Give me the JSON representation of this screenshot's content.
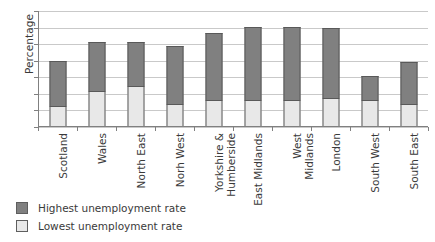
{
  "chart_data": {
    "type": "bar",
    "subtype": "stacked-bar",
    "title": "",
    "xlabel": "",
    "ylabel": "Percentage",
    "ylim": [
      0,
      14
    ],
    "yticks": [
      0,
      2,
      4,
      6,
      8,
      10,
      12,
      14
    ],
    "ytick_labels": [
      "0",
      "2",
      "4",
      "6",
      "8",
      "10",
      "12",
      "14"
    ],
    "grid": true,
    "grid_axis": "y",
    "legend_position": "below-left",
    "categories": [
      "Scotland",
      "Wales",
      "North East",
      "Norh West",
      "Yorkshire &\nHumberside",
      "East Midlands",
      "West Midlands",
      "London",
      "South West",
      "South East"
    ],
    "series": [
      {
        "name": "Lowest unemployment rate",
        "color": "#e8e8e8",
        "values": [
          2.5,
          4.3,
          5.0,
          2.8,
          3.2,
          3.2,
          3.3,
          3.5,
          3.2,
          2.8
        ]
      },
      {
        "name": "Highest unemployment rate",
        "color": "#808080",
        "values": [
          8.0,
          10.3,
          10.25,
          9.8,
          11.4,
          12.1,
          12.05,
          12.0,
          6.1,
          7.8
        ],
        "note": "values are bar tops (cumulative), not segment heights"
      }
    ]
  },
  "legend": {
    "items": [
      {
        "label": "Highest unemployment rate",
        "color": "#808080"
      },
      {
        "label": "Lowest unemployment rate",
        "color": "#e8e8e8"
      }
    ]
  },
  "colors": {
    "highest": "#808080",
    "lowest": "#e8e8e8",
    "gridline": "#c9c9c9",
    "axis": "#808080",
    "bar_border": "#595959",
    "text": "#3a3a3a",
    "background": "#ffffff"
  }
}
